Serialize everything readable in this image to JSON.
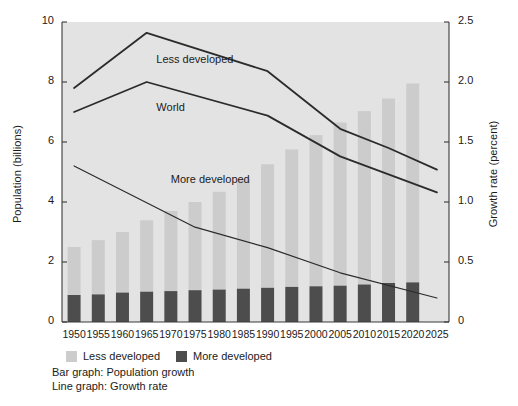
{
  "chart_data": {
    "type": "bar",
    "title": "",
    "subtitle": "",
    "xlabel": "",
    "ylabel": "Population (billions)",
    "y2label": "Growth rate (percent)",
    "ylim": [
      0,
      10
    ],
    "yticks": [
      "0",
      "2",
      "4",
      "6",
      "8",
      "10"
    ],
    "ytick_values": [
      0,
      2,
      4,
      6,
      8,
      10
    ],
    "y2lim": [
      0,
      2.5
    ],
    "y2ticks": [
      "0",
      "0.5",
      "1.0",
      "1.5",
      "2.0",
      "2.5"
    ],
    "y2tick_values": [
      0,
      0.5,
      1.0,
      1.5,
      2.0,
      2.5
    ],
    "grid": false,
    "legend_position": "below-axes",
    "categories": [
      "1950",
      "1955",
      "1960",
      "1965",
      "1970",
      "1975",
      "1980",
      "1985",
      "1990",
      "1995",
      "2000",
      "2005",
      "2010",
      "2015",
      "2020",
      "2025"
    ],
    "bar_series": [
      {
        "name": "More developed",
        "color": "#4d4d4d",
        "values": [
          0.9,
          0.92,
          0.98,
          1.01,
          1.03,
          1.06,
          1.08,
          1.11,
          1.14,
          1.17,
          1.19,
          1.21,
          1.25,
          1.3,
          1.32,
          null
        ]
      },
      {
        "name": "Less developed",
        "color": "#cccccc",
        "values": [
          1.6,
          1.81,
          2.02,
          2.38,
          2.67,
          2.94,
          3.26,
          3.65,
          4.12,
          4.58,
          5.04,
          5.44,
          5.78,
          6.15,
          6.63,
          null
        ]
      }
    ],
    "bar_totals": [
      2.5,
      2.73,
      3.0,
      3.39,
      3.7,
      4.0,
      4.34,
      4.76,
      5.26,
      5.75,
      6.23,
      6.65,
      7.03,
      7.45,
      7.95,
      null
    ],
    "line_series": [
      {
        "name": "Less developed",
        "axis": "right",
        "x": [
          "1950",
          "1965",
          "1990",
          "2005",
          "2015",
          "2025"
        ],
        "values": [
          1.95,
          2.41,
          2.09,
          1.61,
          1.45,
          1.27
        ]
      },
      {
        "name": "World",
        "axis": "right",
        "x": [
          "1950",
          "1965",
          "1990",
          "2005",
          "2015",
          "2025"
        ],
        "values": [
          1.75,
          2.0,
          1.72,
          1.38,
          1.23,
          1.08
        ]
      },
      {
        "name": "More developed",
        "axis": "right",
        "x": [
          "1950",
          "1975",
          "1990",
          "2005",
          "2025"
        ],
        "values": [
          1.3,
          0.79,
          0.62,
          0.41,
          0.2
        ]
      }
    ],
    "annotations": [
      {
        "text": "Less developed",
        "x": 1967,
        "y_percent": 2.16
      },
      {
        "text": "World",
        "x": 1967,
        "y_percent": 1.76
      },
      {
        "text": "More developed",
        "x": 1970,
        "y_percent": 1.16
      }
    ]
  },
  "legend": {
    "entries": [
      {
        "label": "Less developed",
        "color": "#cccccc"
      },
      {
        "label": "More developed",
        "color": "#4d4d4d"
      }
    ]
  },
  "caption": {
    "bar_note": "Bar graph: Population growth",
    "line_note": "Line graph: Growth rate"
  },
  "colors": {
    "plot_background": "#e3e3e3",
    "less_developed": "#cccccc",
    "more_developed": "#4d4d4d",
    "line": "#2b2b2b",
    "axis": "#3a3a3a",
    "text": "#1b1b1b"
  }
}
